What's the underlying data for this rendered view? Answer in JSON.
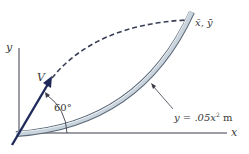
{
  "diagram": {
    "type": "projectile-onto-parabolic-track",
    "labels": {
      "y_axis": "y",
      "x_axis": "x",
      "velocity": "V",
      "angle": "60°",
      "coords_prefix": "x̄, ȳ",
      "curve_eq_lhs": "y = .05x",
      "curve_eq_exp": "2",
      "curve_eq_unit": " m"
    },
    "values": {
      "launch_angle_deg": 60,
      "curve_coefficient": 0.05,
      "curve_unit": "m"
    },
    "colors": {
      "axis": "#3b3b4a",
      "velocity_arrow": "#1f2a5a",
      "trajectory_dash": "#3a3f55",
      "track_fill": "#c9d3dc",
      "track_edge": "#5d6a7a",
      "text": "#3a3a3a"
    }
  }
}
